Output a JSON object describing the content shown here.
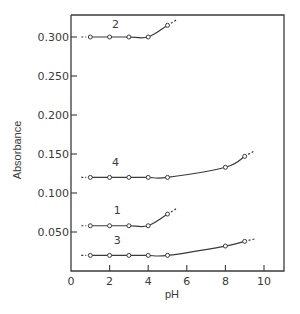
{
  "chart_data": {
    "type": "line",
    "title": "",
    "xlabel": "pH",
    "ylabel": "Absorbance",
    "xlim": [
      0,
      11
    ],
    "ylim": [
      0,
      0.32
    ],
    "grid": false,
    "legend": "inline curve numbers",
    "x_ticks": [
      0,
      2,
      4,
      6,
      8,
      10
    ],
    "x_tick_labels": [
      "0",
      "2",
      "4",
      "6",
      "8",
      "10"
    ],
    "y_ticks": [
      0.05,
      0.1,
      0.15,
      0.2,
      0.25,
      0.3
    ],
    "y_tick_labels": [
      "0.050",
      "0.100",
      "0.150",
      "0.200",
      "0.250",
      "0.300"
    ],
    "series": [
      {
        "name": "2",
        "x": [
          1,
          2,
          3,
          4,
          5
        ],
        "values": [
          0.3,
          0.3,
          0.3,
          0.3,
          0.315
        ],
        "label_pos": [
          2.3,
          0.312
        ]
      },
      {
        "name": "4",
        "x": [
          1,
          2,
          3,
          4,
          5,
          8,
          9
        ],
        "values": [
          0.12,
          0.12,
          0.12,
          0.12,
          0.12,
          0.133,
          0.147
        ],
        "label_pos": [
          2.3,
          0.134
        ]
      },
      {
        "name": "1",
        "x": [
          1,
          2,
          3,
          4,
          5
        ],
        "values": [
          0.058,
          0.058,
          0.058,
          0.058,
          0.073
        ],
        "label_pos": [
          2.4,
          0.073
        ]
      },
      {
        "name": "3",
        "x": [
          1,
          2,
          3,
          4,
          5,
          8,
          9
        ],
        "values": [
          0.02,
          0.02,
          0.02,
          0.02,
          0.02,
          0.032,
          0.038
        ],
        "label_pos": [
          2.4,
          0.034
        ]
      }
    ]
  }
}
